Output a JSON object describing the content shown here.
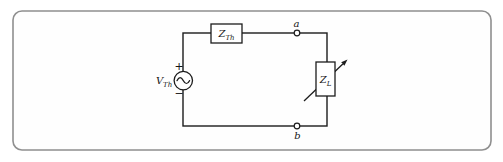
{
  "colors": {
    "frame_border": "#8f8f8f",
    "ink": "#1c1c1c",
    "background": "#ffffff"
  },
  "circuit": {
    "source": {
      "label_base": "V",
      "label_sub": "Th",
      "plus": "+",
      "minus": "−"
    },
    "thevenin_impedance": {
      "label_base": "Z",
      "label_sub": "Th"
    },
    "load_impedance": {
      "label_base": "Z",
      "label_sub": "L"
    },
    "terminals": {
      "top": "a",
      "bottom": "b"
    }
  }
}
